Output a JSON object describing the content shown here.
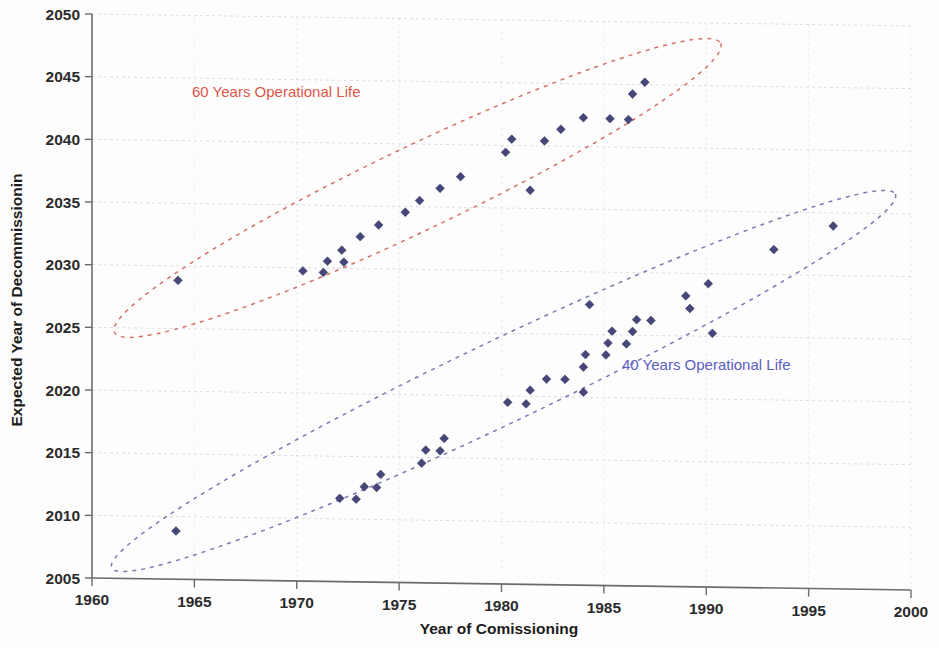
{
  "chart_data": {
    "type": "scatter",
    "title": "",
    "xlabel": "Year of Comissioning",
    "ylabel": "Expected Year of Decommissioning",
    "ylabel_rendered": "Expected Year of Decommissionin",
    "xlim": [
      1960,
      2000
    ],
    "ylim": [
      2005,
      2050
    ],
    "xticks": [
      "1960",
      "1965",
      "1970",
      "1975",
      "1980",
      "1985",
      "1990",
      "1995",
      "2000"
    ],
    "yticks": [
      "2005",
      "2010",
      "2015",
      "2020",
      "2025",
      "2030",
      "2035",
      "2040",
      "2045",
      "2050"
    ],
    "grid": true,
    "legend_position": "none",
    "marker_color": "#46467a",
    "marker_shape": "diamond",
    "annotations": [
      {
        "id": "annot-60",
        "text": "60 Years Operational Life",
        "color": "#e2564a",
        "x": 1969.0,
        "y": 2043.6
      },
      {
        "id": "annot-40",
        "text": "40 Years Operational Life",
        "color": "#5c5cc4",
        "x": 1990.0,
        "y": 2022.3
      }
    ],
    "groupings": [
      {
        "id": "ellipse-60-years",
        "label": "60 Years Operational Life",
        "color": "#d4706a",
        "cx": 1975.9,
        "cy": 2036.5,
        "rx": 16.4,
        "ry": 3.35,
        "rotation_deg": -25.5
      },
      {
        "id": "ellipse-40-years",
        "label": "40 Years Operational Life",
        "color": "#7a7ab4",
        "cx": 1980.1,
        "cy": 2021.2,
        "rx": 21.2,
        "ry": 3.3,
        "rotation_deg": -25.5
      }
    ],
    "series": [
      {
        "name": "60 Years Operational Life",
        "color": "#46467a",
        "points": [
          [
            1964.2,
            2028.85
          ],
          [
            1970.3,
            2029.75
          ],
          [
            1971.3,
            2029.65
          ],
          [
            1971.5,
            2030.55
          ],
          [
            1972.2,
            2031.45
          ],
          [
            1972.3,
            2030.5
          ],
          [
            1973.1,
            2032.55
          ],
          [
            1974.0,
            2033.5
          ],
          [
            1975.3,
            2034.55
          ],
          [
            1976.0,
            2035.5
          ],
          [
            1977.0,
            2036.5
          ],
          [
            1978.0,
            2037.45
          ],
          [
            1980.2,
            2039.45
          ],
          [
            1980.5,
            2040.5
          ],
          [
            1981.4,
            2036.45
          ],
          [
            1982.1,
            2040.4
          ],
          [
            1982.9,
            2041.35
          ],
          [
            1984.0,
            2042.3
          ],
          [
            1985.3,
            2042.25
          ],
          [
            1986.2,
            2042.2
          ],
          [
            1986.4,
            2044.25
          ],
          [
            1987.0,
            2045.2
          ]
        ]
      },
      {
        "name": "40 Years Operational Life",
        "color": "#46467a",
        "points": [
          [
            1964.1,
            2008.85
          ],
          [
            1972.1,
            2011.65
          ],
          [
            1972.9,
            2011.6
          ],
          [
            1973.3,
            2012.6
          ],
          [
            1973.9,
            2012.55
          ],
          [
            1974.1,
            2013.6
          ],
          [
            1976.1,
            2014.55
          ],
          [
            1976.3,
            2015.6
          ],
          [
            1977.0,
            2015.55
          ],
          [
            1977.2,
            2016.55
          ],
          [
            1980.3,
            2019.5
          ],
          [
            1981.2,
            2019.4
          ],
          [
            1981.4,
            2020.5
          ],
          [
            1982.2,
            2021.4
          ],
          [
            1983.1,
            2021.4
          ],
          [
            1984.0,
            2020.4
          ],
          [
            1984.0,
            2022.4
          ],
          [
            1984.1,
            2023.4
          ],
          [
            1984.3,
            2027.4
          ],
          [
            1985.1,
            2023.4
          ],
          [
            1985.2,
            2024.35
          ],
          [
            1985.4,
            2025.3
          ],
          [
            1986.1,
            2024.3
          ],
          [
            1986.4,
            2025.3
          ],
          [
            1986.6,
            2026.25
          ],
          [
            1987.3,
            2026.2
          ],
          [
            1989.0,
            2028.2
          ],
          [
            1989.2,
            2027.2
          ],
          [
            1990.1,
            2029.2
          ],
          [
            1990.3,
            2025.25
          ],
          [
            1993.3,
            2032.0
          ],
          [
            1996.2,
            2033.95
          ]
        ]
      }
    ]
  },
  "axes": {
    "x_title": "Year of Comissioning",
    "y_title": "Expected Year of Decommissionin"
  }
}
